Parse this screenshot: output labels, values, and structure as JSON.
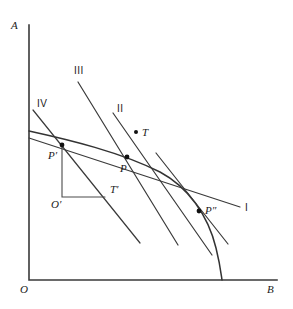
{
  "figure": {
    "type": "line-diagram",
    "background": "#ffffff",
    "ink_color": "#333333",
    "axes": {
      "y_label": "A",
      "x_label": "B",
      "origin_label": "O",
      "x_axis_from": [
        29,
        280
      ],
      "x_axis_to": [
        277,
        280
      ],
      "y_axis_from": [
        29,
        25
      ],
      "y_axis_to": [
        29,
        280
      ]
    },
    "points": [
      {
        "name": "P-prime",
        "label": "P′",
        "x": 62,
        "y": 145,
        "label_x": 48,
        "label_y": 150
      },
      {
        "name": "P",
        "label": "P",
        "x": 127,
        "y": 157,
        "label_x": 120,
        "label_y": 163
      },
      {
        "name": "P-double",
        "label": "P″",
        "x": 199,
        "y": 211,
        "label_x": 205,
        "label_y": 206
      },
      {
        "name": "T",
        "label": "T",
        "x": 136,
        "y": 132,
        "label_x": 142,
        "label_y": 127
      },
      {
        "name": "O-prime",
        "label": "O′",
        "x": 62,
        "y": 197,
        "label_x": 51,
        "label_y": 201
      },
      {
        "name": "T-prime",
        "label": "T′",
        "x": 105,
        "y": 197,
        "label_x": 110,
        "label_y": 185
      }
    ],
    "line_labels": [
      {
        "name": "line-I",
        "label": "I",
        "x": 245,
        "y": 203
      },
      {
        "name": "line-II",
        "label": "II",
        "x": 118,
        "y": 105
      },
      {
        "name": "line-III",
        "label": "III",
        "x": 74,
        "y": 66
      },
      {
        "name": "line-IV",
        "label": "IV",
        "x": 37,
        "y": 99
      }
    ],
    "curve_description": "production possibility frontier, concave to origin, from y-axis at (29,131) to x-axis at (222,280)",
    "curve_path": "M 29 131 C 70 140, 120 152, 160 172 C 188 187, 208 215, 216 248 C 220 264, 221 273, 222 280",
    "tangents": [
      {
        "name": "tangent-I",
        "from": [
          29,
          138
        ],
        "to": [
          240,
          207
        ]
      },
      {
        "name": "tangent-II",
        "from": [
          113,
          113
        ],
        "to": [
          212,
          255
        ]
      },
      {
        "name": "tangent-III",
        "from": [
          78,
          82
        ],
        "to": [
          178,
          245
        ]
      },
      {
        "name": "tangent-IV",
        "from": [
          33,
          110
        ],
        "to": [
          140,
          243
        ]
      },
      {
        "name": "tangent-at-Pdouble",
        "from": [
          156,
          153
        ],
        "to": [
          228,
          244
        ]
      }
    ],
    "right_angle": {
      "name": "right-angle-marker",
      "vertical_from": [
        62,
        145
      ],
      "vertical_to": [
        62,
        197
      ],
      "horizontal_from": [
        62,
        197
      ],
      "horizontal_to": [
        105,
        197
      ]
    }
  }
}
